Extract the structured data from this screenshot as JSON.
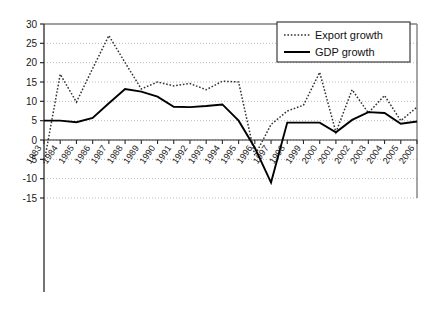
{
  "chart_data": {
    "type": "line",
    "title": "",
    "subtitle": "",
    "xlabel": "",
    "ylabel": "",
    "ylim": [
      -15,
      30
    ],
    "yticks": [
      -15,
      -10,
      -5,
      0,
      5,
      10,
      15,
      20,
      25,
      30
    ],
    "ytick_labels": [
      "-15",
      "-10",
      "-5",
      "0",
      "5",
      "10",
      "15",
      "20",
      "25",
      "30"
    ],
    "grid": true,
    "grid_axis": "y",
    "legend_position": "top-right",
    "categories": [
      "1983",
      "1984",
      "1985",
      "1986",
      "1987",
      "1988",
      "1989",
      "1990",
      "1991",
      "1992",
      "1993",
      "1994",
      "1995",
      "1996",
      "1997",
      "1998",
      "1999",
      "2000",
      "2001",
      "2002",
      "2003",
      "2004",
      "2005",
      "2006"
    ],
    "series": [
      {
        "name": "Export growth",
        "style": "dotted",
        "color": "#333333",
        "values": [
          -6.0,
          17.0,
          9.8,
          18.5,
          27.0,
          20.0,
          13.2,
          15.0,
          14.0,
          14.6,
          13.0,
          15.2,
          15.0,
          -4.0,
          4.0,
          7.5,
          9.0,
          17.5,
          2.0,
          13.0,
          7.0,
          11.5,
          5.0,
          8.5
        ]
      },
      {
        "name": "GDP growth",
        "style": "solid",
        "color": "#000000",
        "values": [
          5.0,
          5.0,
          4.6,
          5.7,
          9.5,
          13.2,
          12.5,
          11.2,
          8.6,
          8.5,
          8.8,
          9.2,
          5.0,
          -2.0,
          -11.0,
          4.5,
          4.5,
          4.5,
          2.0,
          5.2,
          7.2,
          7.0,
          4.2,
          4.8
        ]
      }
    ]
  },
  "legend": {
    "items": [
      {
        "label": "Export growth",
        "swatch": "dotted-line-swatch"
      },
      {
        "label": "GDP growth",
        "swatch": "solid-line-swatch"
      }
    ]
  }
}
